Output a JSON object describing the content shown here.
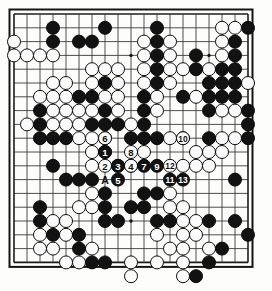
{
  "diagram": {
    "kind": "go-board-problem-diagram",
    "board_size": 19,
    "title": "",
    "caption": "",
    "colors": {
      "board_background": "#fdfdfb",
      "grid_line": "#3a3a3a",
      "frame": "#141414",
      "black_stone": "#121212",
      "white_stone": "#fbfbfb",
      "black_label_text": "#ffffff",
      "white_label_text": "#101010"
    },
    "geometry": {
      "left": 14,
      "top": 14,
      "spacing_x": 13.0,
      "spacing_y": 13.8,
      "stone_radius": 6.5
    },
    "star_points": [
      {
        "col": 4,
        "row": 4
      },
      {
        "col": 10,
        "row": 4
      },
      {
        "col": 16,
        "row": 4
      },
      {
        "col": 4,
        "row": 10
      },
      {
        "col": 10,
        "row": 10
      },
      {
        "col": 16,
        "row": 10
      },
      {
        "col": 4,
        "row": 16
      },
      {
        "col": 10,
        "row": 16
      },
      {
        "col": 16,
        "row": 16
      }
    ],
    "black_stones": [
      {
        "col": 4,
        "row": 2
      },
      {
        "col": 8,
        "row": 2
      },
      {
        "col": 12,
        "row": 2
      },
      {
        "col": 19,
        "row": 2
      },
      {
        "col": 4,
        "row": 3
      },
      {
        "col": 6,
        "row": 3
      },
      {
        "col": 7,
        "row": 3
      },
      {
        "col": 12,
        "row": 3
      },
      {
        "col": 18,
        "row": 3
      },
      {
        "col": 12,
        "row": 4
      },
      {
        "col": 15,
        "row": 4
      },
      {
        "col": 18,
        "row": 4
      },
      {
        "col": 12,
        "row": 5
      },
      {
        "col": 15,
        "row": 5
      },
      {
        "col": 17,
        "row": 5
      },
      {
        "col": 18,
        "row": 5
      },
      {
        "col": 8,
        "row": 6
      },
      {
        "col": 12,
        "row": 6
      },
      {
        "col": 16,
        "row": 6
      },
      {
        "col": 17,
        "row": 6
      },
      {
        "col": 18,
        "row": 6
      },
      {
        "col": 7,
        "row": 7
      },
      {
        "col": 11,
        "row": 7
      },
      {
        "col": 14,
        "row": 7
      },
      {
        "col": 16,
        "row": 7
      },
      {
        "col": 17,
        "row": 7
      },
      {
        "col": 18,
        "row": 7
      },
      {
        "col": 6,
        "row": 7
      },
      {
        "col": 3,
        "row": 8
      },
      {
        "col": 8,
        "row": 8
      },
      {
        "col": 11,
        "row": 8
      },
      {
        "col": 16,
        "row": 8
      },
      {
        "col": 19,
        "row": 8
      },
      {
        "col": 3,
        "row": 9
      },
      {
        "col": 7,
        "row": 9
      },
      {
        "col": 8,
        "row": 9
      },
      {
        "col": 9,
        "row": 9
      },
      {
        "col": 11,
        "row": 9
      },
      {
        "col": 19,
        "row": 9
      },
      {
        "col": 3,
        "row": 10
      },
      {
        "col": 4,
        "row": 10
      },
      {
        "col": 5,
        "row": 10
      },
      {
        "col": 8,
        "row": 10
      },
      {
        "col": 10,
        "row": 10
      },
      {
        "col": 11,
        "row": 10
      },
      {
        "col": 12,
        "row": 10
      },
      {
        "col": 14,
        "row": 10
      },
      {
        "col": 16,
        "row": 10
      },
      {
        "col": 19,
        "row": 10
      },
      {
        "col": 4,
        "row": 12
      },
      {
        "col": 5,
        "row": 13
      },
      {
        "col": 6,
        "row": 13
      },
      {
        "col": 7,
        "row": 13
      },
      {
        "col": 18,
        "row": 13
      },
      {
        "col": 8,
        "row": 14
      },
      {
        "col": 11,
        "row": 14
      },
      {
        "col": 12,
        "row": 14
      },
      {
        "col": 3,
        "row": 15
      },
      {
        "col": 8,
        "row": 15
      },
      {
        "col": 10,
        "row": 15
      },
      {
        "col": 11,
        "row": 15
      },
      {
        "col": 3,
        "row": 16
      },
      {
        "col": 8,
        "row": 16
      },
      {
        "col": 9,
        "row": 16
      },
      {
        "col": 12,
        "row": 16
      },
      {
        "col": 13,
        "row": 16
      },
      {
        "col": 16,
        "row": 16
      },
      {
        "col": 18,
        "row": 16
      },
      {
        "col": 4,
        "row": 17
      },
      {
        "col": 6,
        "row": 17
      },
      {
        "col": 19,
        "row": 17
      },
      {
        "col": 6,
        "row": 18
      },
      {
        "col": 17,
        "row": 18
      },
      {
        "col": 7,
        "row": 19
      },
      {
        "col": 8,
        "row": 19
      },
      {
        "col": 16,
        "row": 19
      },
      {
        "col": 15,
        "row": 20
      }
    ],
    "white_stones": [
      {
        "col": 17,
        "row": 2
      },
      {
        "col": 18,
        "row": 2
      },
      {
        "col": 13,
        "row": 3
      },
      {
        "col": 17,
        "row": 3
      },
      {
        "col": 1,
        "row": 3
      },
      {
        "col": 11,
        "row": 3
      },
      {
        "col": 1,
        "row": 4
      },
      {
        "col": 2,
        "row": 4
      },
      {
        "col": 3,
        "row": 4
      },
      {
        "col": 4,
        "row": 4
      },
      {
        "col": 11,
        "row": 4
      },
      {
        "col": 13,
        "row": 4
      },
      {
        "col": 17,
        "row": 4
      },
      {
        "col": 8,
        "row": 5
      },
      {
        "col": 9,
        "row": 5
      },
      {
        "col": 11,
        "row": 5
      },
      {
        "col": 13,
        "row": 5
      },
      {
        "col": 14,
        "row": 5
      },
      {
        "col": 16,
        "row": 5
      },
      {
        "col": 7,
        "row": 5
      },
      {
        "col": 4,
        "row": 6
      },
      {
        "col": 5,
        "row": 6
      },
      {
        "col": 7,
        "row": 6
      },
      {
        "col": 9,
        "row": 6
      },
      {
        "col": 11,
        "row": 6
      },
      {
        "col": 13,
        "row": 6
      },
      {
        "col": 19,
        "row": 6
      },
      {
        "col": 3,
        "row": 7
      },
      {
        "col": 4,
        "row": 7
      },
      {
        "col": 5,
        "row": 7
      },
      {
        "col": 8,
        "row": 7
      },
      {
        "col": 9,
        "row": 7
      },
      {
        "col": 12,
        "row": 7
      },
      {
        "col": 15,
        "row": 7
      },
      {
        "col": 4,
        "row": 8
      },
      {
        "col": 5,
        "row": 8
      },
      {
        "col": 6,
        "row": 8
      },
      {
        "col": 7,
        "row": 8
      },
      {
        "col": 9,
        "row": 8
      },
      {
        "col": 12,
        "row": 8
      },
      {
        "col": 17,
        "row": 8
      },
      {
        "col": 18,
        "row": 8
      },
      {
        "col": 2,
        "row": 9
      },
      {
        "col": 4,
        "row": 9
      },
      {
        "col": 5,
        "row": 9
      },
      {
        "col": 6,
        "row": 9
      },
      {
        "col": 10,
        "row": 9
      },
      {
        "col": 6,
        "row": 10
      },
      {
        "col": 7,
        "row": 10
      },
      {
        "col": 13,
        "row": 10
      },
      {
        "col": 17,
        "row": 10
      },
      {
        "col": 18,
        "row": 10
      },
      {
        "col": 7,
        "row": 11
      },
      {
        "col": 8,
        "row": 11
      },
      {
        "col": 11,
        "row": 11
      },
      {
        "col": 15,
        "row": 11
      },
      {
        "col": 16,
        "row": 11
      },
      {
        "col": 17,
        "row": 11
      },
      {
        "col": 7,
        "row": 12
      },
      {
        "col": 9,
        "row": 12
      },
      {
        "col": 10,
        "row": 12
      },
      {
        "col": 14,
        "row": 12
      },
      {
        "col": 15,
        "row": 12
      },
      {
        "col": 16,
        "row": 12
      },
      {
        "col": 7,
        "row": 14
      },
      {
        "col": 13,
        "row": 14
      },
      {
        "col": 6,
        "row": 15
      },
      {
        "col": 7,
        "row": 15
      },
      {
        "col": 13,
        "row": 15
      },
      {
        "col": 14,
        "row": 15
      },
      {
        "col": 4,
        "row": 16
      },
      {
        "col": 5,
        "row": 16
      },
      {
        "col": 14,
        "row": 16
      },
      {
        "col": 15,
        "row": 16
      },
      {
        "col": 3,
        "row": 17
      },
      {
        "col": 5,
        "row": 17
      },
      {
        "col": 12,
        "row": 17
      },
      {
        "col": 14,
        "row": 17
      },
      {
        "col": 15,
        "row": 17
      },
      {
        "col": 3,
        "row": 18
      },
      {
        "col": 4,
        "row": 18
      },
      {
        "col": 7,
        "row": 18
      },
      {
        "col": 13,
        "row": 18
      },
      {
        "col": 14,
        "row": 18
      },
      {
        "col": 16,
        "row": 18
      },
      {
        "col": 5,
        "row": 19
      },
      {
        "col": 6,
        "row": 19
      },
      {
        "col": 10,
        "row": 19
      },
      {
        "col": 12,
        "row": 19
      },
      {
        "col": 14,
        "row": 19
      },
      {
        "col": 10,
        "row": 20
      },
      {
        "col": 14,
        "row": 20
      }
    ],
    "move_sequence": [
      {
        "number": "1",
        "col": 8,
        "row": 11,
        "color": "black"
      },
      {
        "number": "2",
        "col": 8,
        "row": 12,
        "color": "white"
      },
      {
        "number": "3",
        "col": 9,
        "row": 12,
        "color": "black"
      },
      {
        "number": "4",
        "col": 10,
        "row": 12,
        "color": "white"
      },
      {
        "number": "5",
        "col": 9,
        "row": 13,
        "color": "black"
      },
      {
        "number": "6",
        "col": 8,
        "row": 10,
        "color": "white"
      },
      {
        "number": "7",
        "col": 11,
        "row": 12,
        "color": "black"
      },
      {
        "number": "8",
        "col": 10,
        "row": 11,
        "color": "white"
      },
      {
        "number": "9",
        "col": 12,
        "row": 12,
        "color": "black"
      },
      {
        "number": "10",
        "col": 14,
        "row": 10,
        "color": "white"
      },
      {
        "number": "11",
        "col": 13,
        "row": 13,
        "color": "black"
      },
      {
        "number": "12",
        "col": 13,
        "row": 12,
        "color": "white"
      },
      {
        "number": "13",
        "col": 14,
        "row": 13,
        "color": "black"
      }
    ],
    "letter_marks": [
      {
        "letter": "A",
        "col": 8,
        "row": 13
      }
    ]
  }
}
